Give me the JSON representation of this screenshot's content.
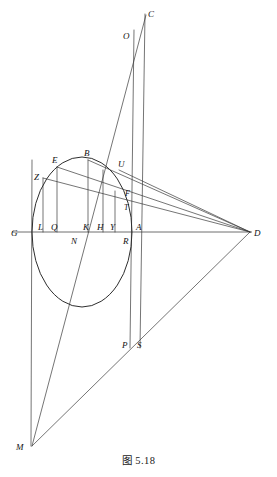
{
  "figure": {
    "caption": "图 5.18",
    "title": "图 5.18",
    "kind": "geometric-construction",
    "canvas": {
      "width": 277,
      "height": 477
    },
    "colors": {
      "line": "#3a3a3a",
      "curve": "#2e2e2e",
      "axis": "#4a4a4a",
      "label": "#111111",
      "background": "#ffffff"
    },
    "ellipse": {
      "cx": 82,
      "cy": 232,
      "rx": 50,
      "ry": 75,
      "description": "conic section (ellipse) centered on the baseline GA"
    },
    "baseline": {
      "name": "GD",
      "y": 232,
      "x_start": 12,
      "x_end": 252
    },
    "points": [
      {
        "id": "C",
        "label": "C",
        "x": 146,
        "y": 13,
        "lx": 148,
        "ly": 15
      },
      {
        "id": "O",
        "label": "O",
        "x": 130,
        "y": 36,
        "lx": 125,
        "ly": 38
      },
      {
        "id": "B",
        "label": "B",
        "x": 88,
        "y": 160,
        "lx": 84,
        "ly": 155
      },
      {
        "id": "E",
        "label": "E",
        "x": 57,
        "y": 167,
        "lx": 53,
        "ly": 162
      },
      {
        "id": "U",
        "label": "U",
        "x": 119,
        "y": 170,
        "lx": 119,
        "ly": 166
      },
      {
        "id": "Z",
        "label": "Z",
        "x": 43,
        "y": 178,
        "lx": 36,
        "ly": 177
      },
      {
        "id": "F",
        "label": "F",
        "x": 128,
        "y": 195,
        "lx": 126,
        "ly": 194
      },
      {
        "id": "T",
        "label": "T",
        "x": 127,
        "y": 206,
        "lx": 125,
        "ly": 209
      },
      {
        "id": "G",
        "label": "G",
        "x": 32,
        "y": 232,
        "lx": 12,
        "ly": 235
      },
      {
        "id": "L",
        "label": "L",
        "x": 43,
        "y": 232,
        "lx": 40,
        "ly": 230
      },
      {
        "id": "Q",
        "label": "Q",
        "x": 57,
        "y": 232,
        "lx": 53,
        "ly": 230
      },
      {
        "id": "K",
        "label": "K",
        "x": 88,
        "y": 232,
        "lx": 85,
        "ly": 230
      },
      {
        "id": "H",
        "label": "H",
        "x": 103,
        "y": 232,
        "lx": 99,
        "ly": 230
      },
      {
        "id": "Y",
        "label": "Y",
        "x": 115,
        "y": 232,
        "lx": 112,
        "ly": 230
      },
      {
        "id": "N",
        "label": "N",
        "x": 76,
        "y": 232,
        "lx": 72,
        "ly": 243
      },
      {
        "id": "R",
        "label": "R",
        "x": 127,
        "y": 232,
        "lx": 124,
        "ly": 243
      },
      {
        "id": "A",
        "label": "A",
        "x": 140,
        "y": 232,
        "lx": 137,
        "ly": 230
      },
      {
        "id": "D",
        "label": "D",
        "x": 250,
        "y": 232,
        "lx": 253,
        "ly": 235
      },
      {
        "id": "P",
        "label": "P",
        "x": 130,
        "y": 345,
        "lx": 124,
        "ly": 348
      },
      {
        "id": "S",
        "label": "S",
        "x": 140,
        "y": 345,
        "lx": 138,
        "ly": 348
      },
      {
        "id": "M",
        "label": "M",
        "x": 32,
        "y": 446,
        "lx": 18,
        "ly": 449
      }
    ],
    "segments": [
      {
        "name": "baseline-G-D",
        "from": "G",
        "to": "D"
      },
      {
        "name": "vertical-C-S",
        "from": "C",
        "to": "S"
      },
      {
        "name": "vertical-O-P",
        "from": "O",
        "to": "P"
      },
      {
        "name": "vertical-G-M",
        "from": "G",
        "to": "M"
      },
      {
        "name": "vertical-L-Z",
        "from": "L",
        "to": "Z"
      },
      {
        "name": "vertical-Q-E",
        "from": "Q",
        "to": "E"
      },
      {
        "name": "vertical-K-B",
        "from": "K",
        "to": "B"
      },
      {
        "name": "vertical-H-U",
        "from": "H",
        "to": "U"
      },
      {
        "name": "vertical-Y-F",
        "from": "Y",
        "to": "F"
      },
      {
        "name": "ray-Z-D",
        "from": "Z",
        "to": "D"
      },
      {
        "name": "ray-E-D",
        "from": "E",
        "to": "D"
      },
      {
        "name": "ray-B-D",
        "from": "B",
        "to": "D"
      },
      {
        "name": "ray-U-D",
        "from": "U",
        "to": "D"
      },
      {
        "name": "ray-M-C",
        "from": "M",
        "to": "C"
      },
      {
        "name": "ray-M-D",
        "from": "M",
        "to": "D"
      },
      {
        "name": "chord-Z-F",
        "from": "Z",
        "to": "F"
      },
      {
        "name": "chord-E-T",
        "from": "E",
        "to": "T"
      }
    ],
    "label_count": 21
  }
}
